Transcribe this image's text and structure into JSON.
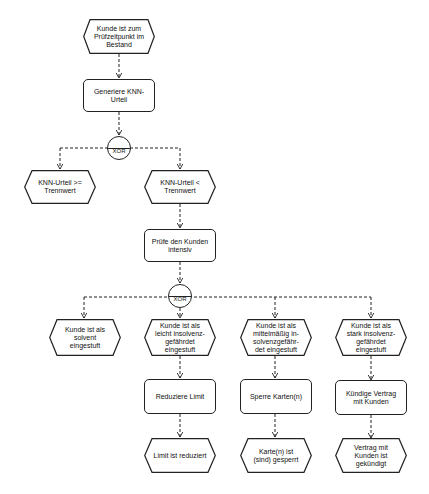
{
  "diagram": {
    "type": "EPK (event-driven process chain)",
    "nodes": {
      "start_event": "Kunde ist zum\nPrüfzeitpunkt im\nBestand",
      "func_generate": "Generiere KNN-\nUrteil",
      "xor1": "XOR",
      "event_above": "KNN-Urteil >=\nTrennwert",
      "event_below": "KNN-Urteil <\nTrennwert",
      "func_check": "Prüfe den Kunden\nintensiv",
      "xor2": "XOR",
      "event_solvent": "Kunde ist als\nsolvent\neingestuft",
      "event_light": "Kunde ist als\nleicht insolvenz-\ngefährdet\neingestuft",
      "event_medium": "Kunde ist als\nmittelmäßig in-\nsolvenzgefähr-\ndet eingestuft",
      "event_strong": "Kunde ist als\nstark insolvenz-\ngefährdet\neingestuft",
      "func_reduce": "Reduziere Limit",
      "func_block": "Sperre Karten(n)",
      "func_cancel": "Kündige Vertrag\nmit Kunden",
      "end_reduced": "Limit ist reduziert",
      "end_blocked": "Karte(n) ist\n(sind) gesperrt",
      "end_cancelled": "Vertrag mit\nKunden ist\ngekündigt"
    },
    "colors": {
      "stroke": "#222222",
      "background": "#ffffff",
      "text": "#111111"
    }
  }
}
